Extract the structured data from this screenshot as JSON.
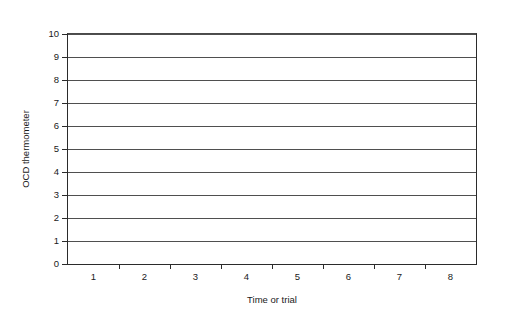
{
  "chart_data": {
    "type": "line",
    "title": "",
    "subtitle": "",
    "xlabel": "Time or trial",
    "ylabel": "OCD thermometer",
    "categories": [
      "1",
      "2",
      "3",
      "4",
      "5",
      "6",
      "7",
      "8"
    ],
    "series": [],
    "x_tick_labels": [
      "1",
      "2",
      "3",
      "4",
      "5",
      "6",
      "7",
      "8"
    ],
    "y_tick_labels": [
      "0",
      "1",
      "2",
      "3",
      "4",
      "5",
      "6",
      "7",
      "8",
      "9",
      "10"
    ],
    "y_values": [
      0,
      1,
      2,
      3,
      4,
      5,
      6,
      7,
      8,
      9,
      10
    ],
    "ylim": [
      0,
      10
    ],
    "y_major_step": 1,
    "gridlines": {
      "horizontal": true,
      "vertical": false,
      "values": [
        1,
        2,
        3,
        4,
        5,
        6,
        7,
        8,
        9,
        10
      ]
    },
    "legend": {
      "visible": false,
      "position": "none",
      "entries": []
    },
    "annotations": [],
    "plot_frame": "box",
    "note": "Empty plotting grid with no data plotted",
    "colors": {
      "background": "#ffffff",
      "axis": "#2b2b2b",
      "gridline": "#4f4f4f",
      "text": "#1a1a1a"
    }
  }
}
